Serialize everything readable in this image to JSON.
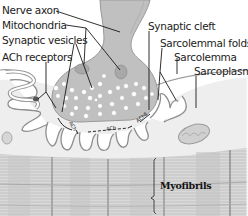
{
  "diagram": {
    "labels": {
      "nerve_axon": "Nerve axon",
      "mitochondria": "Mitochondria",
      "synaptic_vesicles": "Synaptic vesicles",
      "ach_receptors": "ACh receptors",
      "synaptic_cleft": "Synaptic cleft",
      "sarcolemmal_folds": "Sarcolemmal folds",
      "sarcolemma": "Sarcolemma",
      "sarcoplasm": "Sarcoplasm",
      "myofibrils": "Myofibrils"
    },
    "cleft_annotations": {
      "ach_left": "ACh",
      "ach_mid": "ACh",
      "ach_right": "AChE"
    },
    "colors": {
      "axon_fill": "#bdbdbd",
      "terminal_fill": "#c4c4c4",
      "muscle_fill": "#ececec",
      "myofibril_fill": "#d6d6d6",
      "outline": "#8a8a8a",
      "leader_line": "#222222",
      "vesicle": "#ffffff"
    }
  }
}
